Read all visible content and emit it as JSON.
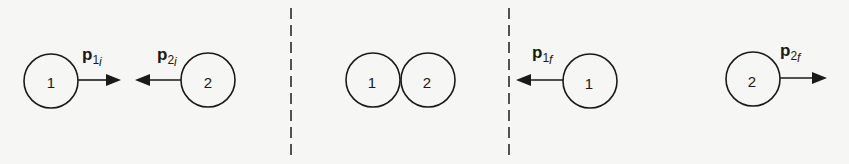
{
  "panels": [
    {
      "name": "before-collision",
      "balls": [
        {
          "label": "1",
          "cx": 51,
          "cy": 81,
          "r": 27
        },
        {
          "label": "2",
          "cx": 208,
          "cy": 80,
          "r": 27
        }
      ],
      "vectors": [
        {
          "symbol": "p",
          "sub_num": "1",
          "sub_letter": "i",
          "direction": "right"
        },
        {
          "symbol": "p",
          "sub_num": "2",
          "sub_letter": "i",
          "direction": "left"
        }
      ]
    },
    {
      "name": "during-collision",
      "balls": [
        {
          "label": "1",
          "cx": 373,
          "cy": 80,
          "r": 27
        },
        {
          "label": "2",
          "cx": 428,
          "cy": 80,
          "r": 27
        }
      ]
    },
    {
      "name": "after-collision",
      "balls": [
        {
          "label": "1",
          "cx": 590,
          "cy": 81,
          "r": 27
        },
        {
          "label": "2",
          "cx": 753,
          "cy": 79,
          "r": 27
        }
      ],
      "vectors": [
        {
          "symbol": "p",
          "sub_num": "1",
          "sub_letter": "f",
          "direction": "left"
        },
        {
          "symbol": "p",
          "sub_num": "2",
          "sub_letter": "f",
          "direction": "right"
        }
      ]
    }
  ],
  "dividers": [
    {
      "x": 291
    },
    {
      "x": 509
    }
  ]
}
